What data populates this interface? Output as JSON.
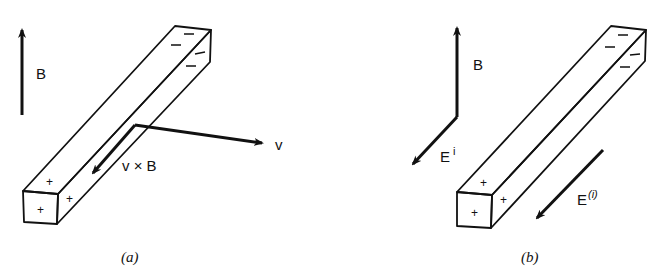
{
  "figure": {
    "panels": [
      {
        "id": "a",
        "caption": "(a)",
        "labels": {
          "B": "B",
          "v": "v",
          "vxB": "v × B"
        },
        "charges": {
          "near_end": [
            "+",
            "+",
            "+"
          ],
          "far_end": [
            "—",
            "—",
            "—",
            "—"
          ]
        }
      },
      {
        "id": "b",
        "caption": "(b)",
        "labels": {
          "B": "B",
          "Ei_base": "E",
          "Ei_sup": "i",
          "Eparen_base": "E",
          "Eparen_sup": "(i)"
        },
        "charges": {
          "near_end": [
            "+",
            "+",
            "+"
          ],
          "far_end": [
            "—",
            "—",
            "—",
            "—"
          ]
        }
      }
    ],
    "colors": {
      "ink": "#111111",
      "background": "#ffffff"
    }
  }
}
